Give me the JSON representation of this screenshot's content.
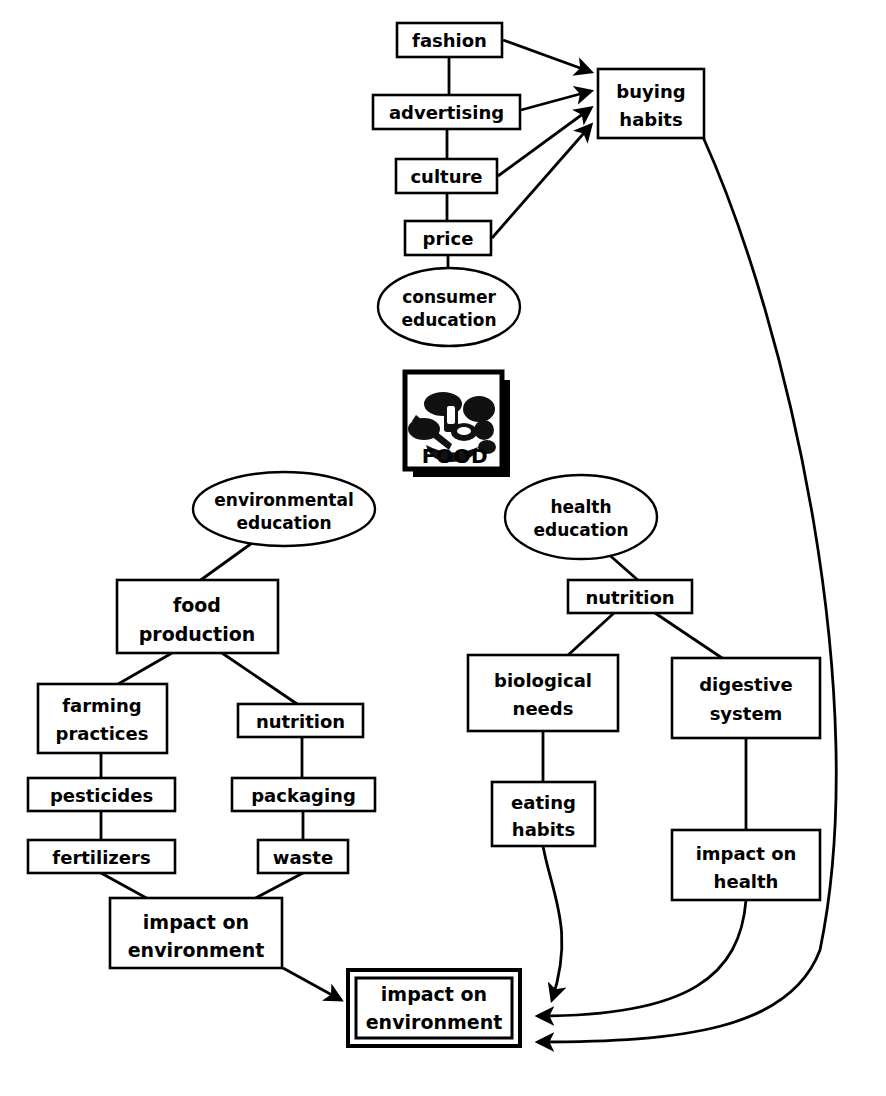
{
  "diagram": {
    "center_icon": {
      "label": "FOOD",
      "icon_name": "food-basket-icon"
    },
    "nodes": [
      {
        "id": "fashion",
        "label": "fashion",
        "shape": "rect",
        "x": 397,
        "y": 23,
        "w": 105,
        "h": 34,
        "lines": [
          "fashion"
        ]
      },
      {
        "id": "advertising",
        "label": "advertising",
        "shape": "rect",
        "x": 373,
        "y": 95,
        "w": 147,
        "h": 34,
        "lines": [
          "advertising"
        ]
      },
      {
        "id": "culture",
        "label": "culture",
        "shape": "rect",
        "x": 396,
        "y": 159,
        "w": 101,
        "h": 34,
        "lines": [
          "culture"
        ]
      },
      {
        "id": "price",
        "label": "price",
        "shape": "rect",
        "x": 405,
        "y": 221,
        "w": 86,
        "h": 34,
        "lines": [
          "price"
        ]
      },
      {
        "id": "buying-habits",
        "label": "buying habits",
        "shape": "rect",
        "x": 598,
        "y": 69,
        "w": 106,
        "h": 69,
        "lines": [
          "buying",
          "habits"
        ]
      },
      {
        "id": "consumer-education",
        "label": "consumer education",
        "shape": "ellipse",
        "x": 378,
        "y": 268,
        "w": 142,
        "h": 78,
        "lines": [
          "consumer",
          "education"
        ]
      },
      {
        "id": "environmental-education",
        "label": "environmental education",
        "shape": "ellipse",
        "x": 193,
        "y": 473,
        "w": 183,
        "h": 73,
        "lines": [
          "environmental",
          "education"
        ]
      },
      {
        "id": "health-education",
        "label": "health education",
        "shape": "ellipse",
        "x": 505,
        "y": 475,
        "w": 152,
        "h": 84,
        "lines": [
          "health",
          "education"
        ]
      },
      {
        "id": "food-production",
        "label": "food production",
        "shape": "rect",
        "x": 117,
        "y": 580,
        "w": 161,
        "h": 73,
        "lines": [
          "food",
          "production"
        ]
      },
      {
        "id": "nutrition-health",
        "label": "nutrition",
        "shape": "rect",
        "x": 568,
        "y": 580,
        "w": 124,
        "h": 33,
        "lines": [
          "nutrition"
        ]
      },
      {
        "id": "farming-practices",
        "label": "farming practices",
        "shape": "rect",
        "x": 38,
        "y": 684,
        "w": 129,
        "h": 69,
        "lines": [
          "farming",
          "practices"
        ]
      },
      {
        "id": "nutrition-env",
        "label": "nutrition",
        "shape": "rect",
        "x": 238,
        "y": 704,
        "w": 125,
        "h": 33,
        "lines": [
          "nutrition"
        ]
      },
      {
        "id": "biological-needs",
        "label": "biological needs",
        "shape": "rect",
        "x": 468,
        "y": 655,
        "w": 150,
        "h": 76,
        "lines": [
          "biological",
          "needs"
        ]
      },
      {
        "id": "digestive-system",
        "label": "digestive system",
        "shape": "rect",
        "x": 672,
        "y": 658,
        "w": 148,
        "h": 80,
        "lines": [
          "digestive",
          "system"
        ]
      },
      {
        "id": "pesticides",
        "label": "pesticides",
        "shape": "rect",
        "x": 28,
        "y": 778,
        "w": 147,
        "h": 33,
        "lines": [
          "pesticides"
        ]
      },
      {
        "id": "packaging",
        "label": "packaging",
        "shape": "rect",
        "x": 232,
        "y": 778,
        "w": 143,
        "h": 33,
        "lines": [
          "packaging"
        ]
      },
      {
        "id": "eating-habits",
        "label": "eating habits",
        "shape": "rect",
        "x": 492,
        "y": 782,
        "w": 103,
        "h": 64,
        "lines": [
          "eating",
          "habits"
        ]
      },
      {
        "id": "fertilizers",
        "label": "fertilizers",
        "shape": "rect",
        "x": 28,
        "y": 840,
        "w": 147,
        "h": 33,
        "lines": [
          "fertilizers"
        ]
      },
      {
        "id": "waste",
        "label": "waste",
        "shape": "rect",
        "x": 258,
        "y": 840,
        "w": 90,
        "h": 33,
        "lines": [
          "waste"
        ]
      },
      {
        "id": "impact-on-health",
        "label": "impact on health",
        "shape": "rect",
        "x": 672,
        "y": 830,
        "w": 148,
        "h": 70,
        "lines": [
          "impact on",
          "health"
        ]
      },
      {
        "id": "impact-on-environment-mid",
        "label": "impact on environment",
        "shape": "rect",
        "x": 110,
        "y": 898,
        "w": 172,
        "h": 70,
        "lines": [
          "impact on",
          "environment"
        ]
      },
      {
        "id": "impact-on-environment-goal",
        "label": "impact on environment",
        "shape": "double-rect",
        "x": 348,
        "y": 970,
        "w": 172,
        "h": 76,
        "lines": [
          "impact on",
          "environment"
        ]
      }
    ],
    "edges": [
      {
        "from": "fashion",
        "to": "advertising",
        "type": "line"
      },
      {
        "from": "advertising",
        "to": "culture",
        "type": "line"
      },
      {
        "from": "culture",
        "to": "price",
        "type": "line"
      },
      {
        "from": "price",
        "to": "consumer-education",
        "type": "line"
      },
      {
        "from": "fashion",
        "to": "buying-habits",
        "type": "arrow"
      },
      {
        "from": "advertising",
        "to": "buying-habits",
        "type": "arrow"
      },
      {
        "from": "culture",
        "to": "buying-habits",
        "type": "arrow"
      },
      {
        "from": "price",
        "to": "buying-habits",
        "type": "arrow"
      },
      {
        "from": "environmental-education",
        "to": "food-production",
        "type": "line"
      },
      {
        "from": "food-production",
        "to": "farming-practices",
        "type": "line"
      },
      {
        "from": "food-production",
        "to": "nutrition-env",
        "type": "line"
      },
      {
        "from": "farming-practices",
        "to": "pesticides",
        "type": "line"
      },
      {
        "from": "pesticides",
        "to": "fertilizers",
        "type": "line"
      },
      {
        "from": "nutrition-env",
        "to": "packaging",
        "type": "line"
      },
      {
        "from": "packaging",
        "to": "waste",
        "type": "line"
      },
      {
        "from": "fertilizers",
        "to": "impact-on-environment-mid",
        "type": "line"
      },
      {
        "from": "waste",
        "to": "impact-on-environment-mid",
        "type": "line"
      },
      {
        "from": "impact-on-environment-mid",
        "to": "impact-on-environment-goal",
        "type": "arrow"
      },
      {
        "from": "health-education",
        "to": "nutrition-health",
        "type": "line"
      },
      {
        "from": "nutrition-health",
        "to": "biological-needs",
        "type": "line"
      },
      {
        "from": "nutrition-health",
        "to": "digestive-system",
        "type": "line"
      },
      {
        "from": "biological-needs",
        "to": "eating-habits",
        "type": "line"
      },
      {
        "from": "digestive-system",
        "to": "impact-on-health",
        "type": "line"
      },
      {
        "from": "eating-habits",
        "to": "impact-on-environment-goal",
        "type": "curved-arrow"
      },
      {
        "from": "impact-on-health",
        "to": "impact-on-environment-goal",
        "type": "curved-arrow"
      },
      {
        "from": "buying-habits",
        "to": "impact-on-environment-goal",
        "type": "curved-arrow"
      }
    ]
  }
}
